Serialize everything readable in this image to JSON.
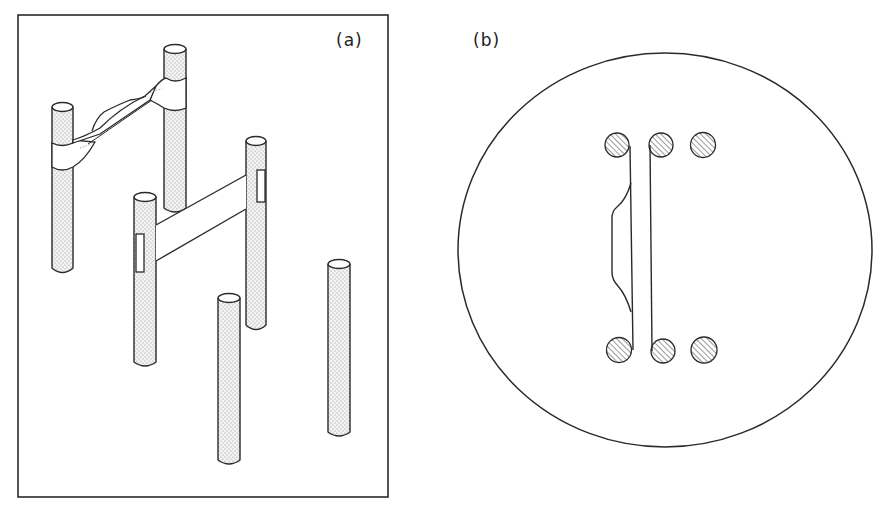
{
  "figure": {
    "panel_a": {
      "label": "(a)",
      "description": "Perspective view of vertical posts (stippled rods) with film bridges spanning pairs of posts",
      "posts": [
        {
          "id": "p1",
          "x": 52,
          "w": 21,
          "top": 103,
          "bottom": 273
        },
        {
          "id": "p2",
          "x": 164,
          "w": 22,
          "top": 45,
          "bottom": 213
        },
        {
          "id": "p3",
          "x": 134,
          "w": 22,
          "top": 193,
          "bottom": 367
        },
        {
          "id": "p4",
          "x": 246,
          "w": 20,
          "top": 137,
          "bottom": 330
        },
        {
          "id": "p5",
          "x": 218,
          "w": 22,
          "top": 294,
          "bottom": 465
        },
        {
          "id": "p6",
          "x": 328,
          "w": 22,
          "top": 260,
          "bottom": 437
        }
      ],
      "bridges": [
        {
          "id": "necked-film",
          "from": "p1",
          "to": "p2"
        },
        {
          "id": "flat-film",
          "from": "p3",
          "to": "p4"
        }
      ]
    },
    "panel_b": {
      "label": "(b)",
      "description": "Top view: circular boundary with two rows of three hatched post cross-sections; film strips connecting posts",
      "posts_top_row": [
        "left",
        "middle",
        "right"
      ],
      "posts_bottom_row": [
        "left",
        "middle",
        "right"
      ]
    },
    "colors": {
      "line": "#2a2a2a",
      "stipple": "#9a9a9a",
      "background": "#ffffff"
    }
  }
}
